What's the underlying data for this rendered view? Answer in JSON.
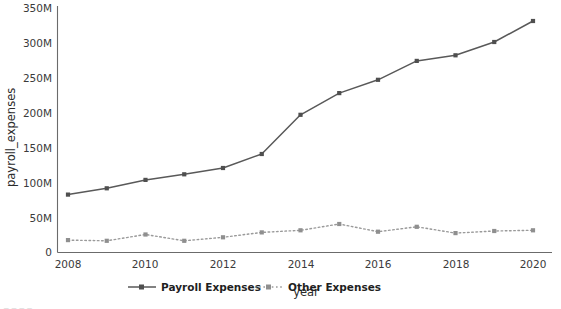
{
  "chart_data": {
    "type": "line",
    "title": "",
    "xlabel": "year",
    "ylabel": "payroll_expenses",
    "x": [
      2008,
      2009,
      2010,
      2011,
      2012,
      2013,
      2014,
      2015,
      2016,
      2017,
      2018,
      2019,
      2020
    ],
    "xlim": [
      2007.6,
      2020.4
    ],
    "ylim": [
      0,
      360
    ],
    "xticks": [
      2008,
      2010,
      2012,
      2014,
      2016,
      2018,
      2020
    ],
    "xtick_labels": [
      "2008",
      "2010",
      "2012",
      "2014",
      "2016",
      "2018",
      "2020"
    ],
    "yticks": [
      0,
      50,
      100,
      150,
      200,
      250,
      300,
      350
    ],
    "ytick_labels": [
      "0",
      "50M",
      "100M",
      "150M",
      "200M",
      "250M",
      "300M",
      "350M"
    ],
    "grid": false,
    "legend_position": "below-center",
    "series": [
      {
        "name": "Payroll Expenses",
        "style": "solid",
        "marker": "square",
        "color": "#595959",
        "values": [
          82,
          91,
          103,
          111,
          120,
          140,
          196,
          227,
          246,
          273,
          281,
          300,
          330
        ]
      },
      {
        "name": "Other Expenses",
        "style": "dotted",
        "marker": "square",
        "color": "#9a9a9a",
        "values": [
          17,
          16,
          25,
          16,
          21,
          28,
          31,
          40,
          29,
          36,
          27,
          30,
          31
        ]
      }
    ]
  },
  "legend": {
    "entries": [
      {
        "label": "Payroll Expenses"
      },
      {
        "label": "Other Expenses"
      }
    ]
  },
  "footer": {
    "clipped_text": "_ _  _   _ "
  }
}
